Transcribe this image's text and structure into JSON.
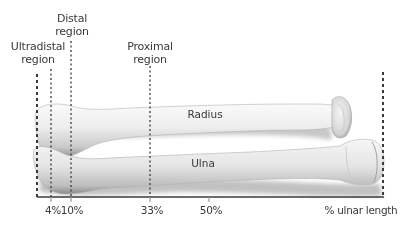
{
  "diagram": {
    "type": "anatomical-diagram",
    "bones": [
      {
        "name": "Radius",
        "label": "Radius"
      },
      {
        "name": "Ulna",
        "label": "Ulna"
      }
    ],
    "regions": [
      {
        "id": "ultradistal",
        "line1": "Ultradistal",
        "line2": "region",
        "position_pct": "4%"
      },
      {
        "id": "distal",
        "line1": "Distal",
        "line2": "region",
        "position_pct": "10%"
      },
      {
        "id": "proximal",
        "line1": "Proximal",
        "line2": "region",
        "position_pct": "33%"
      }
    ],
    "axis": {
      "ticks": [
        "4%",
        "10%",
        "33%",
        "50%"
      ],
      "label": "% ulnar length"
    },
    "colors": {
      "line": "#3a3a3a",
      "bone_light": "#f2f2f2",
      "bone_shadow": "#a8a8a8",
      "text": "#3a3a3a"
    }
  }
}
